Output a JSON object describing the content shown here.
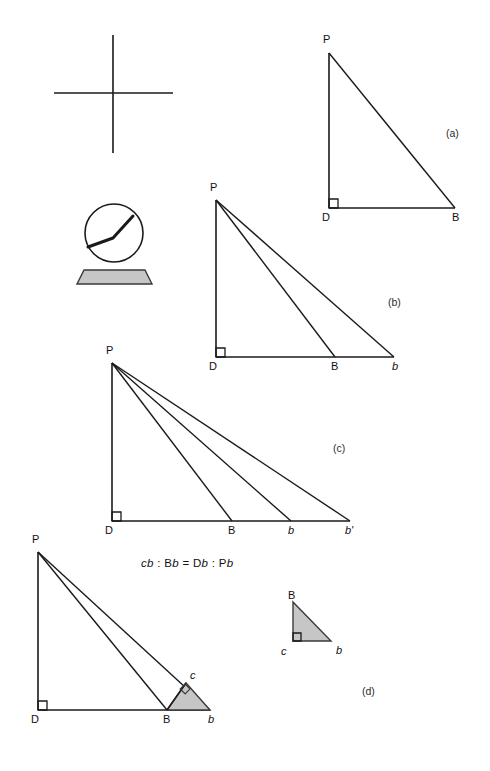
{
  "figure": {
    "background_color": "#ffffff",
    "stroke_color": "#1a1a1a",
    "shade_color": "#c6c6c6",
    "shade_stroke": "#3a3a3a"
  },
  "instruments": {
    "cross": {
      "name": "plumb-cross",
      "horizontal": {
        "x1": 54,
        "y1": 93,
        "x2": 173,
        "y2": 93
      },
      "vertical": {
        "x1": 113,
        "y1": 35,
        "x2": 113,
        "y2": 153
      }
    },
    "dial": {
      "name": "circular-dial-instrument",
      "center_x": 114,
      "center_y": 233,
      "radius": 29,
      "pointer": [
        [
          88,
          247
        ],
        [
          113,
          238
        ],
        [
          133,
          216
        ]
      ],
      "base": [
        [
          84,
          270
        ],
        [
          145,
          270
        ],
        [
          152,
          284
        ],
        [
          77,
          284
        ]
      ]
    }
  },
  "panels": [
    {
      "id": "a",
      "label": "(a)",
      "label_x": 446,
      "label_y": 128,
      "apex": {
        "name": "P",
        "x": 329,
        "y": 53
      },
      "foot": {
        "name": "D",
        "x": 329,
        "y": 208
      },
      "base_points": [
        {
          "name": "B",
          "x": 455,
          "y": 208
        }
      ],
      "right_angle_at": "D",
      "vertex_labels": [
        {
          "text": "P",
          "x": 323,
          "y": 34,
          "italic": false
        },
        {
          "text": "D",
          "x": 322,
          "y": 212,
          "italic": false
        },
        {
          "text": "B",
          "x": 452,
          "y": 212,
          "italic": false
        }
      ]
    },
    {
      "id": "b",
      "label": "(b)",
      "label_x": 388,
      "label_y": 297,
      "apex": {
        "name": "P",
        "x": 216,
        "y": 200
      },
      "foot": {
        "name": "D",
        "x": 216,
        "y": 357
      },
      "base_points": [
        {
          "name": "B",
          "x": 335,
          "y": 357
        },
        {
          "name": "b",
          "x": 394,
          "y": 357
        }
      ],
      "right_angle_at": "D",
      "vertex_labels": [
        {
          "text": "P",
          "x": 210,
          "y": 182,
          "italic": false
        },
        {
          "text": "D",
          "x": 209,
          "y": 361,
          "italic": false
        },
        {
          "text": "B",
          "x": 331,
          "y": 361,
          "italic": false
        },
        {
          "text": "b",
          "x": 392,
          "y": 361,
          "italic": true
        }
      ]
    },
    {
      "id": "c",
      "label": "(c)",
      "label_x": 333,
      "label_y": 443,
      "apex": {
        "name": "P",
        "x": 112,
        "y": 363
      },
      "foot": {
        "name": "D",
        "x": 112,
        "y": 521
      },
      "base_points": [
        {
          "name": "B",
          "x": 232,
          "y": 521
        },
        {
          "name": "b",
          "x": 291,
          "y": 521
        },
        {
          "name": "b'",
          "x": 350,
          "y": 521
        }
      ],
      "right_angle_at": "D",
      "vertex_labels": [
        {
          "text": "P",
          "x": 106,
          "y": 345,
          "italic": false
        },
        {
          "text": "D",
          "x": 105,
          "y": 525,
          "italic": false
        },
        {
          "text": "B",
          "x": 228,
          "y": 525,
          "italic": false
        },
        {
          "text": "b",
          "x": 288,
          "y": 525,
          "italic": true
        },
        {
          "text": "b'",
          "x": 345,
          "y": 525,
          "italic": true
        }
      ]
    },
    {
      "id": "d",
      "label": "(d)",
      "label_x": 362,
      "label_y": 686,
      "apex": {
        "name": "P",
        "x": 38,
        "y": 552
      },
      "foot": {
        "name": "D",
        "x": 38,
        "y": 710
      },
      "base_points": [
        {
          "name": "B",
          "x": 167,
          "y": 710
        },
        {
          "name": "b",
          "x": 210,
          "y": 710
        }
      ],
      "perp_point": {
        "name": "c",
        "x": 186,
        "y": 683
      },
      "right_angle_at": "D",
      "shaded_triangle": [
        [
          167,
          710
        ],
        [
          186,
          683
        ],
        [
          210,
          710
        ]
      ],
      "vertex_labels": [
        {
          "text": "P",
          "x": 32,
          "y": 534,
          "italic": false
        },
        {
          "text": "D",
          "x": 31,
          "y": 714,
          "italic": false
        },
        {
          "text": "B",
          "x": 163,
          "y": 714,
          "italic": false
        },
        {
          "text": "b",
          "x": 208,
          "y": 714,
          "italic": true
        },
        {
          "text": "c",
          "x": 190,
          "y": 670,
          "italic": true
        }
      ]
    }
  ],
  "detail": {
    "id": "detail-triangle",
    "name": "similar-triangle-Bcb",
    "points": {
      "B": [
        293,
        602
      ],
      "c": [
        293,
        641
      ],
      "b": [
        331,
        641
      ]
    },
    "shaded": true,
    "right_angle_at": "c",
    "vertex_labels": [
      {
        "text": "B",
        "x": 288,
        "y": 590,
        "italic": false
      },
      {
        "text": "c",
        "x": 281,
        "y": 646,
        "italic": true
      },
      {
        "text": "b",
        "x": 336,
        "y": 645,
        "italic": true
      }
    ]
  },
  "formula": {
    "x": 141,
    "y": 558,
    "parts": [
      {
        "text": "c",
        "italic": true
      },
      {
        "text": "b",
        "italic": true
      },
      {
        "text": " : ",
        "italic": false
      },
      {
        "text": "B",
        "italic": false
      },
      {
        "text": "b",
        "italic": true
      },
      {
        "text": " = ",
        "italic": false
      },
      {
        "text": "D",
        "italic": false
      },
      {
        "text": "b",
        "italic": true
      },
      {
        "text": " : ",
        "italic": false
      },
      {
        "text": "P",
        "italic": false
      },
      {
        "text": "b",
        "italic": true
      }
    ],
    "plain": "cb : Bb = Db : Pb"
  }
}
